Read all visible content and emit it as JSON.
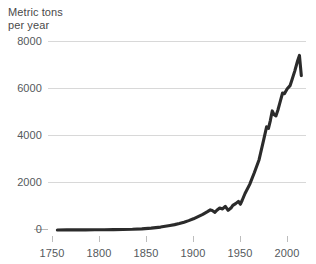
{
  "chart_data": {
    "type": "line",
    "title": "",
    "subtitle": "",
    "ylabel_line1": "Metric tons",
    "ylabel_line2": "per year",
    "ylabel": "Metric tons per year",
    "xlabel": "",
    "xlim": [
      1740,
      2015
    ],
    "ylim": [
      0,
      8400
    ],
    "grid": true,
    "gridlines_y": [
      2000,
      4000,
      6000,
      8000
    ],
    "legend": "none",
    "series_color": "#2b2b2b",
    "grid_color": "#d8d8d8",
    "text_color": "#55595c",
    "y_ticks": [
      "0",
      "2000",
      "4000",
      "6000",
      "8000"
    ],
    "y_tick_values": [
      0,
      2000,
      4000,
      6000,
      8000
    ],
    "x_ticks": [
      "1750",
      "1800",
      "1850",
      "1900",
      "1950",
      "2000"
    ],
    "x_tick_values": [
      1750,
      1800,
      1850,
      1900,
      1950,
      2000
    ],
    "series": [
      {
        "name": "Emissions",
        "x": [
          1750,
          1760,
          1770,
          1780,
          1790,
          1800,
          1810,
          1820,
          1830,
          1840,
          1850,
          1860,
          1870,
          1875,
          1880,
          1885,
          1890,
          1895,
          1900,
          1905,
          1910,
          1913,
          1915,
          1918,
          1920,
          1923,
          1926,
          1929,
          1932,
          1935,
          1937,
          1940,
          1943,
          1945,
          1947,
          1950,
          1955,
          1960,
          1965,
          1970,
          1973,
          1975,
          1977,
          1979,
          1981,
          1983,
          1985,
          1987,
          1990,
          1992,
          1995,
          1998,
          2000,
          2003,
          2006,
          2008,
          2010
        ],
        "y": [
          3,
          4,
          5,
          7,
          9,
          12,
          16,
          22,
          32,
          52,
          85,
          130,
          200,
          240,
          290,
          350,
          420,
          500,
          600,
          700,
          820,
          900,
          870,
          790,
          880,
          980,
          940,
          1060,
          880,
          980,
          1100,
          1180,
          1280,
          1150,
          1330,
          1630,
          2040,
          2570,
          3140,
          4050,
          4610,
          4540,
          4890,
          5320,
          5150,
          5100,
          5350,
          5660,
          6120,
          6090,
          6310,
          6450,
          6700,
          7100,
          7550,
          7800,
          6900
        ]
      }
    ]
  },
  "plot_geometry": {
    "left": 48,
    "right": 306,
    "top": 42,
    "bottom": 230
  }
}
